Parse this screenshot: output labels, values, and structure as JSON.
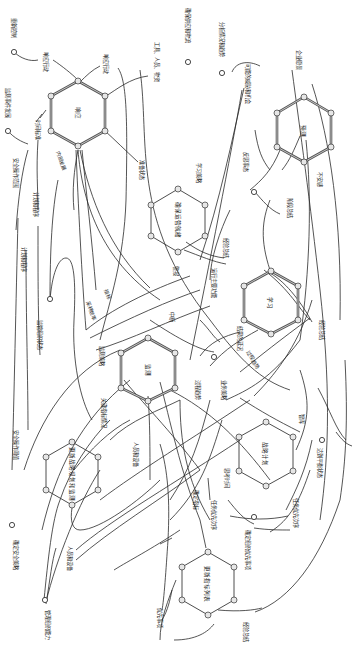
{
  "diagram": {
    "orientation": "rotated-90-clockwise",
    "colors": {
      "line": "#2a2a2a",
      "hex_thick": "#555555",
      "vertex_fill": "#e6e6e6",
      "background": "#ffffff"
    },
    "hexagons": [
      {
        "id": "respond",
        "label": "响应",
        "style": "thick"
      },
      {
        "id": "confirm-operation",
        "label": "确保运营就绪",
        "style": "thin"
      },
      {
        "id": "predict",
        "label": "预测",
        "style": "thick"
      },
      {
        "id": "learn",
        "label": "学习",
        "style": "thick"
      },
      {
        "id": "monitor",
        "label": "监测",
        "style": "thick"
      },
      {
        "id": "update-plan",
        "label": "更新战略规划和监测",
        "style": "thin"
      },
      {
        "id": "strategic-plan",
        "label": "战略计划",
        "style": "thin"
      },
      {
        "id": "update-metrics",
        "label": "更新指标列表",
        "style": "thin"
      }
    ],
    "labels": {
      "l1": "重新控制",
      "l2": "监测事件发展",
      "l3": "响应行动",
      "l4": "响应行动",
      "l5": "时间标准",
      "l6": "工具、人员、物资",
      "l7": "确保供应和物流",
      "l8": "分析情况和趋势",
      "l9": "企业愿景",
      "l10": "可能的威胁和机会",
      "l11": "安全操作范围",
      "l12": "计划和程序",
      "l13": "内部发展",
      "l14": "准备状态",
      "l15": "学习策略",
      "l16": "计划和程序",
      "l17": "反思事态",
      "l18": "阶段总结",
      "l19": "不安感",
      "l20": "监管组织状态",
      "l21": "警报",
      "l22": "运行主要功能",
      "l23": "经验总结",
      "l24": "经验总结",
      "l25": "采样频率",
      "l26": "指标",
      "l27": "中断",
      "l28": "监测策略",
      "l29": "结果的延迟",
      "l30": "过程趋势",
      "l31": "过程趋势",
      "l32": "业务策略",
      "l33": "关键指标情况",
      "l34": "安全操作阈值",
      "l35": "人员和设备",
      "l36": "智库",
      "l37": "思考时间",
      "l38": "达到平衡状态",
      "l39": "确定指标",
      "l40": "任务优先次序",
      "l41": "任务优先次序",
      "l42": "确定安全策略",
      "l43": "人员和设备",
      "l44": "管理组织能力",
      "l45": "确定组织优先事项",
      "l46": "优先事项",
      "l47": "经验总结"
    }
  }
}
